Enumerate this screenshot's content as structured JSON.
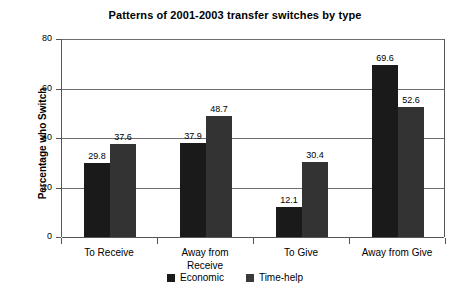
{
  "chart_data": {
    "type": "bar",
    "title": "Patterns of 2001-2003 transfer switches by type",
    "xlabel": "",
    "ylabel": "Percentage who Switch",
    "ylim": [
      0,
      80
    ],
    "yticks": [
      0,
      20,
      40,
      60,
      80
    ],
    "ytick_labels": [
      "0",
      "20",
      "40",
      "60",
      "80"
    ],
    "grid": true,
    "legend_position": "bottom",
    "data_labels": true,
    "categories": [
      "To Receive",
      "Away from Receive",
      "To Give",
      "Away from Give"
    ],
    "category_lines": [
      [
        "To Receive"
      ],
      [
        "Away from",
        "Receive"
      ],
      [
        "To Give"
      ],
      [
        "Away from Give"
      ]
    ],
    "series": [
      {
        "name": "Economic",
        "color": "#1a1a1a",
        "values": [
          29.8,
          37.9,
          12.1,
          69.6
        ],
        "labels": [
          "29.8",
          "37.9",
          "12.1",
          "69.6"
        ]
      },
      {
        "name": "Time-help",
        "color": "#333333",
        "values": [
          37.6,
          48.7,
          30.4,
          52.6
        ],
        "labels": [
          "37.6",
          "48.7",
          "30.4",
          "52.6"
        ]
      }
    ]
  },
  "legend": {
    "items": [
      {
        "label": "Economic",
        "swatch": "legend-swatch-economic"
      },
      {
        "label": "Time-help",
        "swatch": "legend-swatch-time-help"
      }
    ]
  }
}
